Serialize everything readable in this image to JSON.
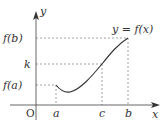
{
  "figure": {
    "type": "function-graph",
    "curve_label": "y = f(x)",
    "axes": {
      "x_label": "x",
      "y_label": "y",
      "origin_label": "O"
    },
    "x_ticks": [
      {
        "label": "a",
        "px": 56
      },
      {
        "label": "c",
        "px": 102
      },
      {
        "label": "b",
        "px": 128
      }
    ],
    "y_ticks": [
      {
        "label": "f(b)",
        "py": 38
      },
      {
        "label": "k",
        "py": 64
      },
      {
        "label": "f(a)",
        "py": 85
      }
    ],
    "points": [
      {
        "name": "A",
        "x": "a",
        "y": "f(a)"
      },
      {
        "name": "C",
        "x": "c",
        "y": "k"
      },
      {
        "name": "B",
        "x": "b",
        "y": "f(b)"
      }
    ],
    "colors": {
      "axis": "#555555",
      "curve": "#333333",
      "guide": "#888888",
      "text": "#333333"
    }
  }
}
